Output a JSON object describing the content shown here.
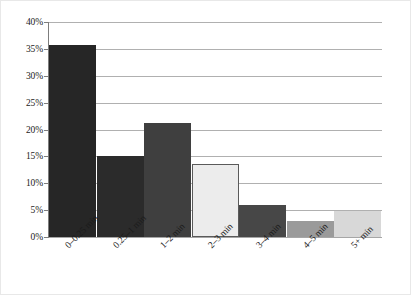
{
  "chart_data": {
    "type": "bar",
    "title": "",
    "subtitle": "",
    "xlabel": "",
    "ylabel": "",
    "categories": [
      "0–0.25 min",
      "0.25–1 min",
      "1–2 min",
      "2–3 min",
      "3–4 min",
      "4–5 min",
      "5+ min"
    ],
    "values": [
      35.7,
      15.1,
      21.2,
      13.5,
      6.0,
      2.9,
      4.9
    ],
    "value_labels": [
      "35.7%",
      "15.1%",
      "21.2%",
      "13.5%",
      "6.0%",
      "2.9%",
      "4.9%"
    ],
    "bar_colors": [
      "#262626",
      "#2b2b2b",
      "#3f3f3f",
      "#ececec",
      "#474747",
      "#9a9a9a",
      "#d8d8d8"
    ],
    "bar_border_colors": [
      "#262626",
      "#2b2b2b",
      "#3f3f3f",
      "#5a5a5a",
      "#474747",
      "#9a9a9a",
      "#d8d8d8"
    ],
    "ylim": [
      0,
      40
    ],
    "ytick_values": [
      0,
      5,
      10,
      15,
      20,
      25,
      30,
      35,
      40
    ],
    "ytick_labels": [
      "0%",
      "5%",
      "10%",
      "15%",
      "20%",
      "25%",
      "30%",
      "35%",
      "40%"
    ],
    "grid": true,
    "grid_axis": "y",
    "legend": false,
    "legend_position": "none",
    "gridline_color": "#b0b0b0",
    "axis_color": "#7d7d7d",
    "background_color": "#ffffff",
    "border_color": "#e8e8e8"
  }
}
